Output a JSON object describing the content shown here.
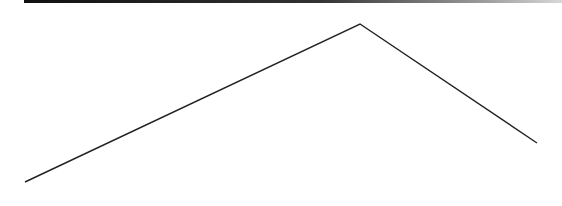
{
  "canvas": {
    "width": 562,
    "height": 206,
    "background": "#ffffff"
  },
  "top_bar": {
    "x": 24,
    "y": 0,
    "width": 538,
    "height": 3,
    "color_start": "#111111",
    "color_end": "#d8d8d8"
  },
  "polyline": {
    "stroke": "#222222",
    "stroke_width": 1.4,
    "points": [
      {
        "x": 25,
        "y": 182
      },
      {
        "x": 360,
        "y": 24
      },
      {
        "x": 537,
        "y": 143
      }
    ]
  }
}
